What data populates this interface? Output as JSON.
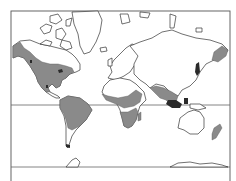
{
  "map": {
    "projection": "Mercator world map",
    "style": {
      "land_fill": "#ffffff",
      "land_outline": "#333333",
      "range_fill": "#8a8a8a",
      "background": "#ffffff"
    },
    "reference_lines": [
      "equator",
      "southern-boundary-line"
    ],
    "legend": null,
    "shaded_regions": [
      "Western and southern North America (Alaska coast to Central America)",
      "Northern and central South America",
      "Sub-Saharan Africa belt",
      "Southern Africa",
      "Madagascar",
      "South and Southeast Asia (India to Indochina)",
      "Maritime Southeast Asia",
      "Japan",
      "Kamchatka / Northeast Asia",
      "New Zealand"
    ]
  }
}
